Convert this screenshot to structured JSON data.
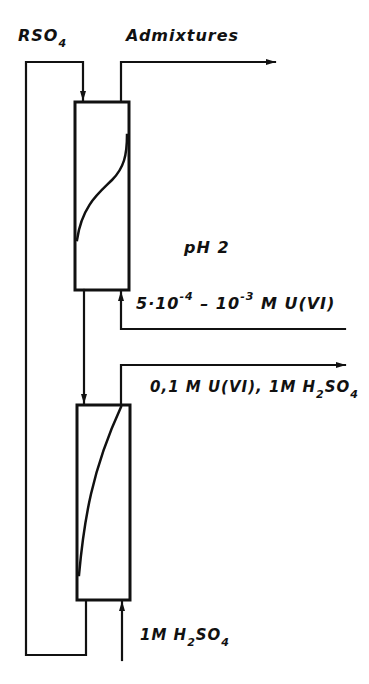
{
  "diagram": {
    "type": "process-flow",
    "colors": {
      "stroke": "#111111",
      "background": "#ffffff"
    },
    "labels": {
      "reagent_in": {
        "main": "RSO",
        "sub": "4"
      },
      "admixtures_out": "Admixtures",
      "ph": "pH 2",
      "feed": {
        "a": "5·10",
        "a_exp": "-4",
        "dash": " – 10",
        "b_exp": "-3",
        "rest": " M U(VI)"
      },
      "eluate": {
        "a": "0,1 M U(VI), 1M H",
        "sub1": "2",
        "b": "SO",
        "sub2": "4"
      },
      "eluent": {
        "a": "1M H",
        "sub1": "2",
        "b": "SO",
        "sub2": "4"
      }
    },
    "nodes": [
      {
        "id": "column-1",
        "name": "Upper column",
        "profile": "S-curve"
      },
      {
        "id": "column-2",
        "name": "Lower column",
        "profile": "concave-curve"
      }
    ]
  }
}
